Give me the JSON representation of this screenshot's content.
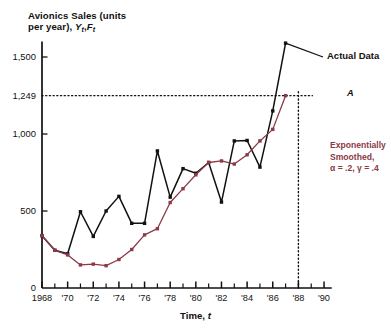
{
  "chart_data": {
    "type": "line",
    "title": "",
    "ylabel": "Avionics Sales (units per year), Yₜ,Fₜ",
    "ylabel_line1": "Avionics Sales (units",
    "ylabel_line2_prefix": "per year), ",
    "ylabel_Y": "Y",
    "ylabel_sub_t1": "t",
    "ylabel_comma": ",",
    "ylabel_F": "F",
    "ylabel_sub_t2": "t",
    "xlabel": "Time, t",
    "xlabel_main": "Time, ",
    "xlabel_ital": "t",
    "ylim": [
      0,
      1600
    ],
    "xlim": [
      1968,
      1990
    ],
    "grid": false,
    "legend_position": "inline-annotations",
    "ytick_labels": [
      "0",
      "500",
      "1,000",
      "1,249",
      "1,500"
    ],
    "ytick_values": [
      0,
      500,
      1000,
      1249,
      1500
    ],
    "xtick_labels": [
      "1968",
      "'70",
      "'72",
      "'74",
      "'76",
      "'78",
      "'80",
      "'82",
      "'84",
      "'86",
      "'88",
      "'90"
    ],
    "xtick_values": [
      1968,
      1970,
      1972,
      1974,
      1976,
      1978,
      1980,
      1982,
      1984,
      1986,
      1988,
      1990
    ],
    "x": [
      1968,
      1969,
      1970,
      1971,
      1972,
      1973,
      1974,
      1975,
      1976,
      1977,
      1978,
      1979,
      1980,
      1981,
      1982,
      1983,
      1984,
      1985,
      1986,
      1987
    ],
    "series": [
      {
        "name": "Actual Data",
        "color": "#111111",
        "marker": "square",
        "values": [
          340,
          245,
          222,
          495,
          335,
          500,
          595,
          420,
          420,
          890,
          590,
          775,
          745,
          815,
          558,
          955,
          958,
          785,
          1150,
          1590
        ]
      },
      {
        "name": "Exponentially Smoothed, α = .2, γ = .4",
        "color": "#8c3a47",
        "marker": "square",
        "values": [
          340,
          245,
          215,
          150,
          155,
          145,
          185,
          250,
          345,
          385,
          555,
          645,
          735,
          815,
          825,
          805,
          865,
          955,
          1030,
          1249
        ]
      }
    ],
    "annotations": [
      {
        "id": "actual-data",
        "text": "Actual Data",
        "color": "#111111"
      },
      {
        "id": "smoothed-l1",
        "text": "Exponentially",
        "color": "#8c3a47"
      },
      {
        "id": "smoothed-l2",
        "text": "Smoothed,",
        "color": "#8c3a47"
      },
      {
        "id": "smoothed-l3",
        "text": "α = .2, γ = .4",
        "color": "#8c3a47"
      },
      {
        "id": "point-a",
        "text": "A",
        "color": "#111111"
      }
    ],
    "reference_lines": [
      {
        "id": "hline-1249",
        "orientation": "horizontal",
        "value": 1249,
        "style": "dotted"
      },
      {
        "id": "vline-1988",
        "orientation": "vertical",
        "value": 1988,
        "style": "dotted"
      }
    ]
  },
  "axes": {
    "y_ticks": [
      {
        "label": "1,500",
        "value": 1500
      },
      {
        "label": "1,249",
        "value": 1249
      },
      {
        "label": "1,000",
        "value": 1000
      },
      {
        "label": "500",
        "value": 500
      },
      {
        "label": "0",
        "value": 0
      }
    ],
    "x_ticks": [
      {
        "label": "1968",
        "value": 1968
      },
      {
        "label": "'70",
        "value": 1970
      },
      {
        "label": "'72",
        "value": 1972
      },
      {
        "label": "'74",
        "value": 1974
      },
      {
        "label": "'76",
        "value": 1976
      },
      {
        "label": "'78",
        "value": 1978
      },
      {
        "label": "'80",
        "value": 1980
      },
      {
        "label": "'82",
        "value": 1982
      },
      {
        "label": "'84",
        "value": 1984
      },
      {
        "label": "'86",
        "value": 1986
      },
      {
        "label": "'88",
        "value": 1988
      },
      {
        "label": "'90",
        "value": 1990
      }
    ]
  },
  "colors": {
    "actual": "#111111",
    "smoothed": "#8c3a47",
    "axis": "#111111",
    "background": "#ffffff"
  }
}
